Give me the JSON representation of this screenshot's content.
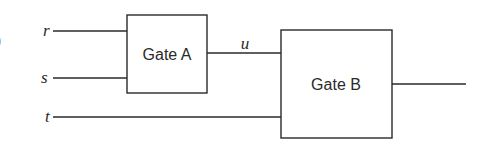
{
  "diagram": {
    "type": "logic-gate-circuit",
    "edge_mark": ")",
    "inputs": [
      {
        "name": "r",
        "y": 31
      },
      {
        "name": "s",
        "y": 78
      },
      {
        "name": "t",
        "y": 117
      }
    ],
    "gates": [
      {
        "id": "A",
        "label": "Gate A",
        "inputs": [
          "r",
          "s"
        ],
        "output": "u"
      },
      {
        "id": "B",
        "label": "Gate B",
        "inputs": [
          "u",
          "t"
        ],
        "output": ""
      }
    ],
    "intermediate": {
      "name": "u"
    },
    "colors": {
      "stroke": "#2a2a2a",
      "background": "#ffffff"
    }
  }
}
